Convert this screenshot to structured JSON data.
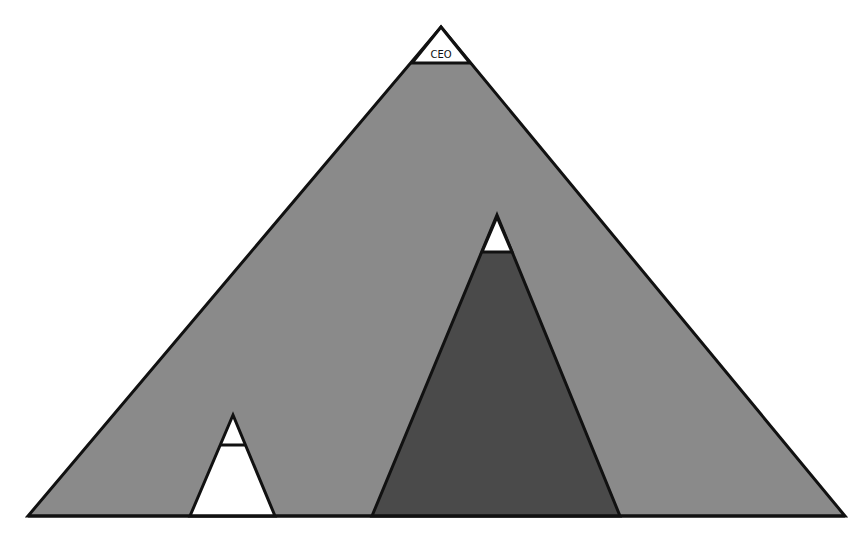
{
  "diagram": {
    "type": "organizational-pyramid",
    "colors": {
      "background": "#ffffff",
      "outer_fill": "#8a8a8a",
      "inner_dark_fill": "#4a4a4a",
      "cap_fill": "#ffffff",
      "small_fill": "#ffffff",
      "stroke": "#111111"
    },
    "outer_pyramid": {
      "apex_label": "CEO"
    },
    "inner_dark_pyramid": {
      "apex_label": ""
    },
    "small_white_pyramid": {
      "apex_label": ""
    }
  }
}
